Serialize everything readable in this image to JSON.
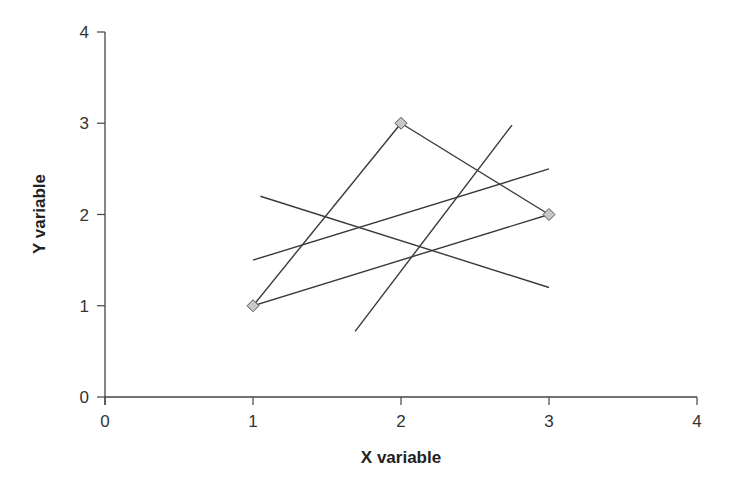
{
  "chart_data": {
    "type": "scatter",
    "title": "",
    "xlabel": "X variable",
    "ylabel": "Y variable",
    "xlim": [
      0,
      4
    ],
    "ylim": [
      0,
      4
    ],
    "xticks": [
      0,
      1,
      2,
      3,
      4
    ],
    "yticks": [
      0,
      1,
      2,
      3,
      4
    ],
    "grid": false,
    "legend": null,
    "points": [
      {
        "x": 1,
        "y": 1
      },
      {
        "x": 2,
        "y": 3
      },
      {
        "x": 3,
        "y": 2
      }
    ],
    "segments": [
      {
        "name": "triangle-edge-1",
        "x": [
          1,
          2
        ],
        "y": [
          1,
          3
        ]
      },
      {
        "name": "triangle-edge-2",
        "x": [
          2,
          3
        ],
        "y": [
          3,
          2
        ]
      },
      {
        "name": "triangle-edge-3",
        "x": [
          1,
          3
        ],
        "y": [
          1,
          2
        ]
      },
      {
        "name": "line-a",
        "x": [
          1,
          3
        ],
        "y": [
          1.5,
          2.5
        ]
      },
      {
        "name": "line-b",
        "x": [
          1.05,
          3
        ],
        "y": [
          2.2,
          1.2
        ]
      },
      {
        "name": "line-c",
        "x": [
          1.69,
          2.75
        ],
        "y": [
          0.72,
          2.98
        ]
      }
    ],
    "colors": {
      "line": "#3a3a3a",
      "marker_fill": "#c8c8c8",
      "marker_stroke": "#555555",
      "axis": "#444444"
    }
  }
}
